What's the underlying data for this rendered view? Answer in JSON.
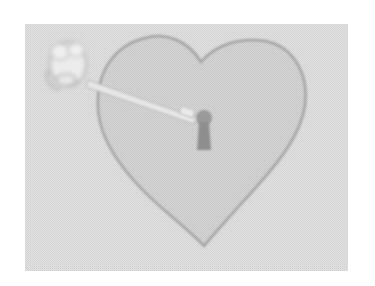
{
  "image": {
    "description": "Grayscale dithered picture of a heart with a keyhole and a key inserted from the upper left",
    "colors": {
      "page_background": "#ffffff",
      "photo_background": "#dcdcdc",
      "heart_fill": "#cdcdcd",
      "heart_outline": "#a2a2a2",
      "keyhole": "#8e8e8e",
      "key": "#e9e9e9",
      "key_outline": "#b0b0b0"
    }
  }
}
